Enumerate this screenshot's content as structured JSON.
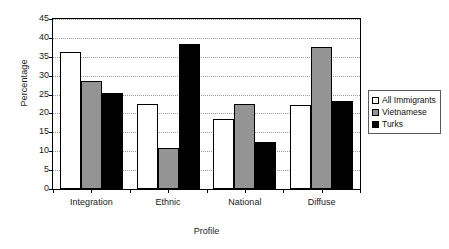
{
  "chart_data": {
    "type": "bar",
    "title": "",
    "xlabel": "Profile",
    "ylabel": "Percentage",
    "ylim": [
      0,
      45
    ],
    "ytick_step": 5,
    "yticks": [
      0,
      5,
      10,
      15,
      20,
      25,
      30,
      35,
      40,
      45
    ],
    "grid": true,
    "legend_position": "right",
    "categories": [
      "Integration",
      "Ethnic",
      "National",
      "Diffuse"
    ],
    "series": [
      {
        "name": "All Immigrants",
        "color": "#ffffff",
        "values": [
          36.2,
          22.4,
          18.6,
          22.3
        ]
      },
      {
        "name": "Vietnamese",
        "color": "#949494",
        "values": [
          28.5,
          10.9,
          22.4,
          37.6
        ]
      },
      {
        "name": "Turks",
        "color": "#000000",
        "values": [
          25.4,
          38.3,
          12.5,
          23.2
        ]
      }
    ]
  },
  "legend": {
    "items": [
      {
        "label": "All Immigrants",
        "swatch": "white-square-icon"
      },
      {
        "label": "Vietnamese",
        "swatch": "gray-square-icon"
      },
      {
        "label": "Turks",
        "swatch": "black-square-icon"
      }
    ]
  }
}
